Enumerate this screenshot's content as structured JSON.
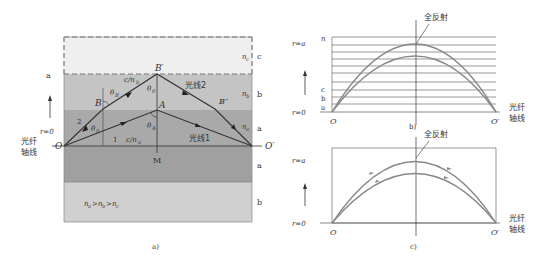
{
  "figure_a": {
    "caption": "a)",
    "layer_labels_right": [
      "c",
      "b",
      "a",
      "a",
      "b"
    ],
    "layer_labels_left": [
      "a"
    ],
    "index_labels": {
      "nc": "n",
      "nc_sub": "c",
      "nb": "n",
      "nb_sub": "b",
      "na": "n",
      "na_sub": "a"
    },
    "points": {
      "O": "O",
      "O_prime": "O′",
      "A": "A",
      "B": "B",
      "B_prime": "B′",
      "B_dprime": "B″",
      "M": "M"
    },
    "angles": {
      "theta0": "θ",
      "theta0_sub": "0",
      "thetaA": "θ",
      "thetaA_sub": "A",
      "thetaB": "θ",
      "thetaB_sub": "B′",
      "theta0_B": "θ",
      "theta0_B_sub": "0"
    },
    "speeds": {
      "upper": "c/n",
      "upper_sub": "b",
      "lower": "c/n",
      "lower_sub": "a"
    },
    "ray_labels": {
      "ray1": "光线1",
      "ray2": "光线2"
    },
    "ray_numbers": [
      "1",
      "2"
    ],
    "axis_labels": {
      "r0": "r=0",
      "axis_line1": "光纤",
      "axis_line2": "轴线"
    },
    "relation": "n_a > n_b > n_c",
    "relation_parts": [
      "n",
      "a",
      ">",
      "n",
      "b",
      ">",
      "n",
      "c"
    ]
  },
  "figure_b": {
    "caption": "b)",
    "top_label": "全反射",
    "y_labels": {
      "ra": "r=a",
      "r0": "r=0",
      "n": "n",
      "c": "c",
      "b": "b",
      "a": "a"
    },
    "points": {
      "O": "O",
      "O_prime": "O′"
    },
    "axis_label_line1": "光纤",
    "axis_label_line2": "轴线",
    "horizontal_layers": 10
  },
  "figure_c": {
    "caption": "c)",
    "top_label": "全反射",
    "y_labels": {
      "ra": "r=a",
      "r0": "r=0"
    },
    "points": {
      "O": "O",
      "O_prime": "O′"
    },
    "axis_label_line1": "光纤",
    "axis_label_line2": "轴线"
  },
  "colors": {
    "layer_c": "#efefef",
    "layer_b": "#c4c4c4",
    "layer_a": "#a6a6a6",
    "layer_b_lower": "#d2d2d2",
    "ray": "#333333",
    "curve": "#888888"
  }
}
